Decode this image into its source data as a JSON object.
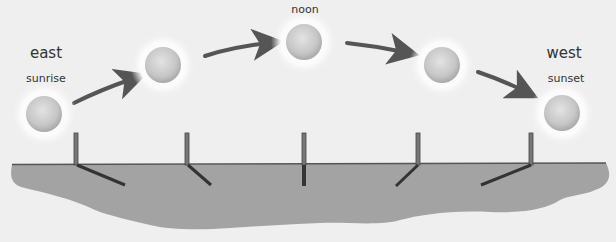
{
  "diagram": {
    "labels": {
      "east": "east",
      "sunrise": "sunrise",
      "noon": "noon",
      "west": "west",
      "sunset": "sunset"
    },
    "suns": [
      {
        "position": "sunrise",
        "cx": 44,
        "cy": 114
      },
      {
        "position": "mid-morning",
        "cx": 163,
        "cy": 65
      },
      {
        "position": "noon",
        "cx": 304,
        "cy": 42
      },
      {
        "position": "mid-afternoon",
        "cx": 442,
        "cy": 65
      },
      {
        "position": "sunset",
        "cx": 562,
        "cy": 113
      }
    ],
    "sticks": [
      {
        "x": 76,
        "shadow": "long-right"
      },
      {
        "x": 187,
        "shadow": "short-right"
      },
      {
        "x": 304,
        "shadow": "none"
      },
      {
        "x": 418,
        "shadow": "short-left"
      },
      {
        "x": 531,
        "shadow": "long-left"
      }
    ],
    "colors": {
      "background": "#efefef",
      "ground": "#a3a3a3",
      "ground_edge": "#555555",
      "arrow": "#555555",
      "stick": "#6b6b6b",
      "shadow": "#333333",
      "sun_core": "#c8c8c8",
      "sun_glow": "#ffffff"
    }
  }
}
